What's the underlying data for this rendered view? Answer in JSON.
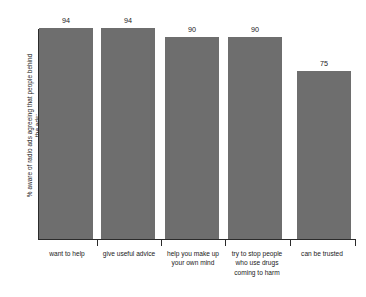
{
  "chart_data": {
    "type": "bar",
    "title": "",
    "xlabel": "",
    "ylabel": "% aware of radio ads agreeing that people behind the ads:",
    "categories": [
      "want to help",
      "give useful advice",
      "help you make up your own mind",
      "try to stop people who use drugs coming to harm",
      "can be trusted"
    ],
    "values": [
      94,
      94,
      90,
      90,
      75
    ],
    "value_labels": [
      "94",
      "94",
      "90",
      "90",
      "75"
    ],
    "ylim": [
      0,
      103
    ],
    "grid": false,
    "legend": false,
    "bar_color": "#6e6e6e",
    "axis_color": "#2b2b2b",
    "background": "#ffffff"
  }
}
